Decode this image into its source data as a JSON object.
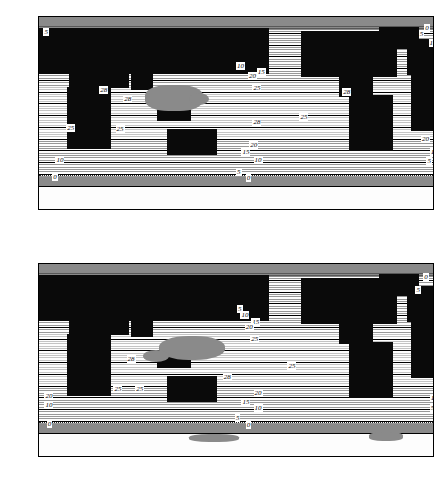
{
  "figure": {
    "panel_count": 2
  },
  "axes": {
    "y_ticks": [
      "90°",
      "60°",
      "30°",
      "0°",
      "−30°",
      "−60°",
      "−90°"
    ],
    "y_values": [
      90,
      60,
      30,
      0,
      -30,
      -60,
      -90
    ],
    "x_ticks": [
      "20°",
      "60°",
      "100°",
      "140°",
      "180°",
      "−140°",
      "−100°",
      "−60°",
      "−20°",
      "0°",
      "20°"
    ],
    "x_values": [
      20,
      60,
      100,
      140,
      180,
      220,
      260,
      300,
      340,
      360,
      380
    ]
  },
  "colors": {
    "land": "#0a0a0a",
    "ice_gray": "#8a8a8a",
    "ocean": "#fdfdfd",
    "contour": "#1a1a1a",
    "frame": "#000000"
  },
  "chart_data": [
    {
      "type": "contour",
      "title": "",
      "xlabel": "",
      "ylabel": "",
      "xlim": [
        20,
        380
      ],
      "ylim": [
        -90,
        90
      ],
      "grid": false,
      "legend": "none",
      "contour_levels": [
        0,
        5,
        10,
        15,
        20,
        25,
        28
      ],
      "labeled_levels": [
        "0",
        "5",
        "10",
        "15",
        "20",
        "25",
        "28"
      ],
      "labels": [
        {
          "text": "5",
          "x": 24,
          "y": 76
        },
        {
          "text": "0",
          "x": 372,
          "y": 80
        },
        {
          "text": "5",
          "x": 367,
          "y": 74
        },
        {
          "text": "10",
          "x": 376,
          "y": 66
        },
        {
          "text": "10",
          "x": 200,
          "y": 44
        },
        {
          "text": "15",
          "x": 219,
          "y": 38
        },
        {
          "text": "20",
          "x": 211,
          "y": 35
        },
        {
          "text": "25",
          "x": 215,
          "y": 23
        },
        {
          "text": "28",
          "x": 75,
          "y": 22
        },
        {
          "text": "28",
          "x": 97,
          "y": 13
        },
        {
          "text": "28",
          "x": 297,
          "y": 20
        },
        {
          "text": "28",
          "x": 215,
          "y": -8
        },
        {
          "text": "25",
          "x": 258,
          "y": -4
        },
        {
          "text": "25",
          "x": 45,
          "y": -14
        },
        {
          "text": "25",
          "x": 90,
          "y": -15
        },
        {
          "text": "20",
          "x": 212,
          "y": -30
        },
        {
          "text": "20",
          "x": 369,
          "y": -24
        },
        {
          "text": "15",
          "x": 205,
          "y": -37
        },
        {
          "text": "15",
          "x": 377,
          "y": -37
        },
        {
          "text": "10",
          "x": 35,
          "y": -44
        },
        {
          "text": "10",
          "x": 216,
          "y": -44
        },
        {
          "text": "5",
          "x": 374,
          "y": -45
        },
        {
          "text": "5",
          "x": 200,
          "y": -55
        },
        {
          "text": "0",
          "x": 32,
          "y": -60
        },
        {
          "text": "0",
          "x": 209,
          "y": -61
        }
      ]
    },
    {
      "type": "contour",
      "title": "",
      "xlabel": "",
      "ylabel": "",
      "xlim": [
        20,
        380
      ],
      "ylim": [
        -90,
        90
      ],
      "grid": false,
      "legend": "none",
      "contour_levels": [
        0,
        5,
        10,
        15,
        20,
        25,
        28
      ],
      "labeled_levels": [
        "0",
        "5",
        "10",
        "15",
        "20",
        "25",
        "28"
      ],
      "labels": [
        {
          "text": "0",
          "x": 371,
          "y": 78
        },
        {
          "text": "5",
          "x": 364,
          "y": 66
        },
        {
          "text": "5",
          "x": 201,
          "y": 48
        },
        {
          "text": "10",
          "x": 204,
          "y": 42
        },
        {
          "text": "15",
          "x": 214,
          "y": 36
        },
        {
          "text": "20",
          "x": 208,
          "y": 31
        },
        {
          "text": "25",
          "x": 213,
          "y": 20
        },
        {
          "text": "28",
          "x": 100,
          "y": 1
        },
        {
          "text": "25",
          "x": 247,
          "y": -6
        },
        {
          "text": "28",
          "x": 188,
          "y": -16
        },
        {
          "text": "25",
          "x": 88,
          "y": -27
        },
        {
          "text": "25",
          "x": 108,
          "y": -27
        },
        {
          "text": "20",
          "x": 216,
          "y": -31
        },
        {
          "text": "20",
          "x": 25,
          "y": -34
        },
        {
          "text": "15",
          "x": 205,
          "y": -39
        },
        {
          "text": "15",
          "x": 377,
          "y": -36
        },
        {
          "text": "10",
          "x": 25,
          "y": -42
        },
        {
          "text": "10",
          "x": 216,
          "y": -45
        },
        {
          "text": "5",
          "x": 377,
          "y": -45
        },
        {
          "text": "5",
          "x": 199,
          "y": -54
        },
        {
          "text": "0",
          "x": 27,
          "y": -60
        },
        {
          "text": "0",
          "x": 209,
          "y": -61
        }
      ]
    }
  ]
}
